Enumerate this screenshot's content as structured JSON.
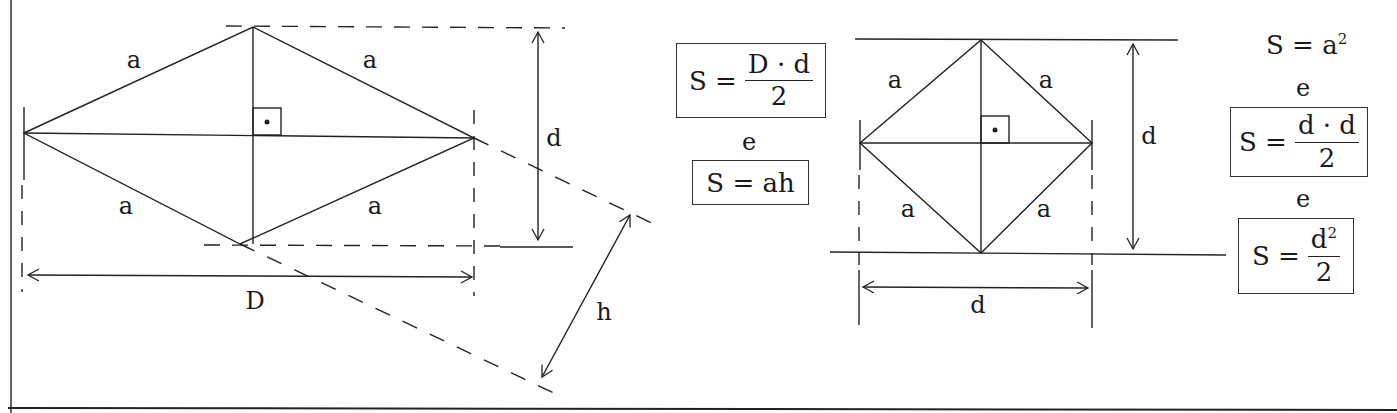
{
  "rhombus_figure": {
    "side_labels": [
      "a",
      "a",
      "a",
      "a"
    ],
    "major_diagonal_label": "D",
    "minor_diagonal_label": "d",
    "height_label": "h",
    "right_angle_marker": true
  },
  "rhombus_formulas": {
    "formula1": {
      "lhs": "S =",
      "numerator": "D · d",
      "denominator": "2"
    },
    "conjunction": "e",
    "formula2": "S = ah"
  },
  "square_figure": {
    "side_labels": [
      "a",
      "a",
      "a",
      "a"
    ],
    "vertical_diagonal_label": "d",
    "horizontal_diagonal_label": "d",
    "right_angle_marker": true
  },
  "square_formulas": {
    "formula1": {
      "lhs": "S = a",
      "exponent": "2"
    },
    "conjunction1": "e",
    "formula2": {
      "lhs": "S =",
      "numerator": "d · d",
      "denominator": "2"
    },
    "conjunction2": "e",
    "formula3": {
      "lhs": "S =",
      "numerator_base": "d",
      "numerator_exp": "2",
      "denominator": "2"
    }
  },
  "colors": {
    "ink": "#1a1a1a",
    "background": "#ffffff"
  }
}
